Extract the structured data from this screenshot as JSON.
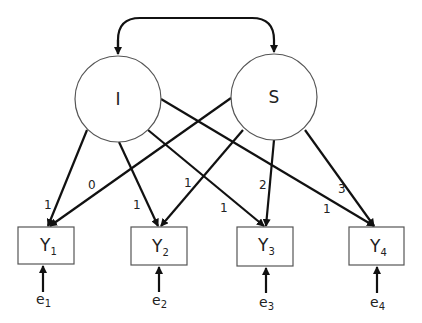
{
  "diagram": {
    "type": "latent growth curve model",
    "latent_factors": [
      {
        "id": "I",
        "label": "I"
      },
      {
        "id": "S",
        "label": "S"
      }
    ],
    "covariance": {
      "from": "I",
      "to": "S",
      "style": "double-headed curved arrow"
    },
    "observed": [
      {
        "id": "Y1",
        "label": "Y",
        "sub": "1"
      },
      {
        "id": "Y2",
        "label": "Y",
        "sub": "2"
      },
      {
        "id": "Y3",
        "label": "Y",
        "sub": "3"
      },
      {
        "id": "Y4",
        "label": "Y",
        "sub": "4"
      }
    ],
    "errors": [
      {
        "label": "e",
        "sub": "1"
      },
      {
        "label": "e",
        "sub": "2"
      },
      {
        "label": "e",
        "sub": "3"
      },
      {
        "label": "e",
        "sub": "4"
      }
    ],
    "loadings": {
      "I": [
        "1",
        "1",
        "1",
        "1"
      ],
      "S": [
        "0",
        "1",
        "2",
        "3"
      ]
    }
  }
}
